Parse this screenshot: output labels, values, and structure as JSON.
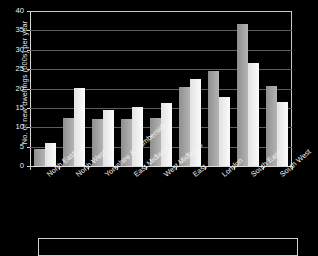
{
  "chart_data": {
    "type": "bar",
    "title": "",
    "xlabel": "",
    "ylabel": "No. of new dwellings (000s) per year",
    "ylim": [
      0,
      40
    ],
    "ytick_values": [
      0,
      5,
      10,
      15,
      20,
      25,
      30,
      35,
      40
    ],
    "ytick_labels": [
      "0",
      "5",
      "10",
      "15",
      "20",
      "25",
      "30",
      "35",
      "40"
    ],
    "grid": true,
    "legend_position": "bottom",
    "categories": [
      "North East",
      "North West",
      "Yorkshire & Humberside",
      "East Midlands",
      "West Midlands",
      "East",
      "London",
      "South East",
      "South West"
    ],
    "series": [
      {
        "name": "series-1",
        "color": "#9a9a9a",
        "values": [
          4.3,
          12.3,
          12.2,
          12.2,
          12.4,
          20.5,
          24.5,
          36.7,
          20.7
        ]
      },
      {
        "name": "series-2",
        "color": "#f0f0f0",
        "values": [
          6.0,
          20.2,
          14.5,
          15.3,
          16.3,
          22.4,
          17.7,
          26.7,
          16.6
        ]
      }
    ]
  },
  "colors": {
    "background": "#000000",
    "gridline": "#5d5d5d",
    "axis": "#d8d8d8",
    "text": "#f0f0f0",
    "series_1": "#9a9a9a",
    "series_2": "#f0f0f0"
  }
}
